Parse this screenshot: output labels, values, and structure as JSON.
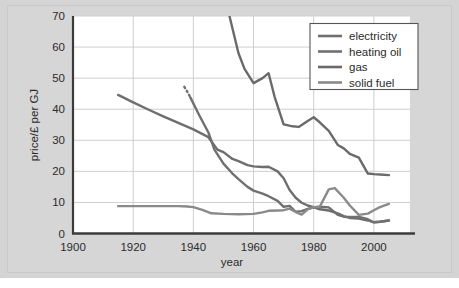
{
  "figure": {
    "background_color": "#d4d4d4",
    "plot_background_color": "#ffffff",
    "grid_color": "#cfcfcf",
    "axis_color": "#4a4a4a"
  },
  "chart_data": {
    "type": "line",
    "title": "",
    "subtitle": "",
    "xlabel": "year",
    "ylabel": "price/£ per GJ",
    "xlim": [
      1900,
      2012
    ],
    "ylim": [
      0,
      70
    ],
    "xticks": [
      1900,
      1920,
      1940,
      1960,
      1980,
      2000
    ],
    "xtick_labels": [
      "1900",
      "1920",
      "1940",
      "1960",
      "1980",
      "2000"
    ],
    "yticks": [
      0,
      10,
      20,
      30,
      40,
      50,
      60,
      70
    ],
    "ytick_labels": [
      "0",
      "10",
      "20",
      "30",
      "40",
      "50",
      "60",
      "70"
    ],
    "grid": true,
    "grid_axis": "both",
    "legend_position": "upper right",
    "legend_entries": [
      "electricity",
      "heating oil",
      "gas",
      "solid fuel"
    ],
    "series": [
      {
        "name": "electricity",
        "color": "#6e6e6e",
        "linestyle": "solid",
        "x": [
          1915,
          1920,
          1925,
          1930,
          1935,
          1940,
          1945,
          1948,
          1950,
          1953,
          1955,
          1958,
          1960,
          1963,
          1965,
          1968,
          1970,
          1972,
          1974,
          1976,
          1978,
          1980,
          1982,
          1985,
          1988,
          1990,
          1992,
          1995,
          1998,
          2000,
          2002,
          2005
        ],
        "y": [
          44.6,
          42.2,
          39.9,
          37.7,
          35.6,
          33.5,
          31.0,
          27.0,
          26.2,
          24.0,
          23.3,
          22.0,
          21.6,
          21.4,
          21.5,
          20.0,
          17.8,
          14.0,
          11.5,
          9.9,
          9.0,
          8.5,
          7.8,
          7.4,
          6.5,
          5.6,
          5.0,
          4.8,
          4.2,
          3.6,
          3.8,
          4.2
        ]
      },
      {
        "name": "heating oil",
        "color": "#707070",
        "linestyle": "dotted-then-solid",
        "dotted_x": [
          1937,
          1938,
          1939
        ],
        "dotted_y": [
          47.2,
          45.6,
          43.8
        ],
        "x": [
          1939,
          1942,
          1945,
          1947,
          1950,
          1953,
          1955,
          1958,
          1960,
          1963,
          1965,
          1968,
          1970,
          1972,
          1974,
          1976,
          1978,
          1980,
          1982,
          1985,
          1988,
          1990,
          1992,
          1995,
          1998,
          2000,
          2002,
          2005
        ],
        "y": [
          43.8,
          38.0,
          32.5,
          27.0,
          22.5,
          19.3,
          17.5,
          15.0,
          13.8,
          12.8,
          12.0,
          10.5,
          8.6,
          8.9,
          7.0,
          7.2,
          7.9,
          8.4,
          8.6,
          8.4,
          6.0,
          5.4,
          5.3,
          5.3,
          4.6,
          3.6,
          3.8,
          4.2
        ]
      },
      {
        "name": "gas",
        "color": "#6a6a6a",
        "linestyle": "solid",
        "x": [
          1952,
          1955,
          1957,
          1960,
          1963,
          1965,
          1967,
          1970,
          1973,
          1975,
          1978,
          1980,
          1982,
          1985,
          1988,
          1990,
          1992,
          1995,
          1998,
          2000,
          2002,
          2005
        ],
        "y": [
          70.0,
          58.0,
          53.0,
          48.4,
          50.0,
          51.6,
          44.0,
          35.1,
          34.5,
          34.3,
          36.2,
          37.4,
          35.8,
          33.0,
          28.5,
          27.4,
          25.6,
          24.4,
          19.3,
          19.1,
          19.0,
          18.8
        ]
      },
      {
        "name": "solid fuel",
        "color": "#8a8a8a",
        "linestyle": "solid",
        "x": [
          1915,
          1920,
          1925,
          1930,
          1935,
          1938,
          1940,
          1943,
          1946,
          1950,
          1955,
          1960,
          1963,
          1965,
          1968,
          1970,
          1972,
          1974,
          1976,
          1978,
          1980,
          1982,
          1985,
          1987,
          1990,
          1992,
          1995,
          1998,
          2000,
          2002,
          2005
        ],
        "y": [
          8.8,
          8.8,
          8.8,
          8.8,
          8.8,
          8.7,
          8.5,
          7.6,
          6.5,
          6.3,
          6.2,
          6.3,
          6.8,
          7.3,
          7.4,
          7.5,
          8.0,
          6.9,
          6.1,
          7.8,
          8.5,
          8.6,
          14.2,
          14.6,
          11.5,
          9.0,
          6.0,
          6.4,
          7.5,
          8.5,
          9.5
        ]
      }
    ]
  }
}
